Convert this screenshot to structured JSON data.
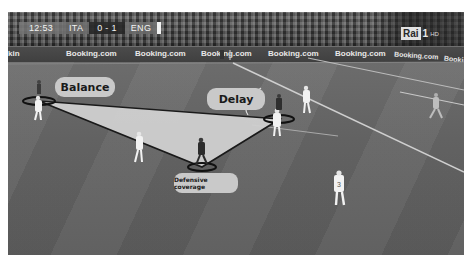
{
  "broadcast": {
    "scoreboard": {
      "clock": "12:53",
      "home_team": "ITA",
      "score": "0 - 1",
      "away_team": "ENG"
    },
    "channel_logo": {
      "name": "Rai",
      "number": "1",
      "quality": "HD"
    },
    "ad_boards": [
      "kin",
      "Booking.com",
      "Booking.com",
      "Booking.com",
      "Booking.com",
      "Booking.com",
      "Booking.com",
      "Booking"
    ]
  },
  "annotations": {
    "labels": {
      "balance": "Balance",
      "delay": "Delay",
      "defensive_coverage": "Defensive coverage"
    },
    "colors": {
      "triangle_fill": "#cfcfcf",
      "triangle_edge": "#1a1a1a",
      "pill_background": "#c9c9c9",
      "ring": "#111111"
    }
  },
  "players": [
    {
      "role": "balance-defender",
      "kit": "white"
    },
    {
      "role": "delay-defender",
      "kit": "white"
    },
    {
      "role": "cover-defender",
      "kit": "dark"
    },
    {
      "role": "midfielder",
      "kit": "white"
    },
    {
      "role": "attacker",
      "kit": "white"
    },
    {
      "role": "winger",
      "kit": "light"
    },
    {
      "role": "defender-number-3",
      "kit": "white",
      "number": "3"
    }
  ]
}
